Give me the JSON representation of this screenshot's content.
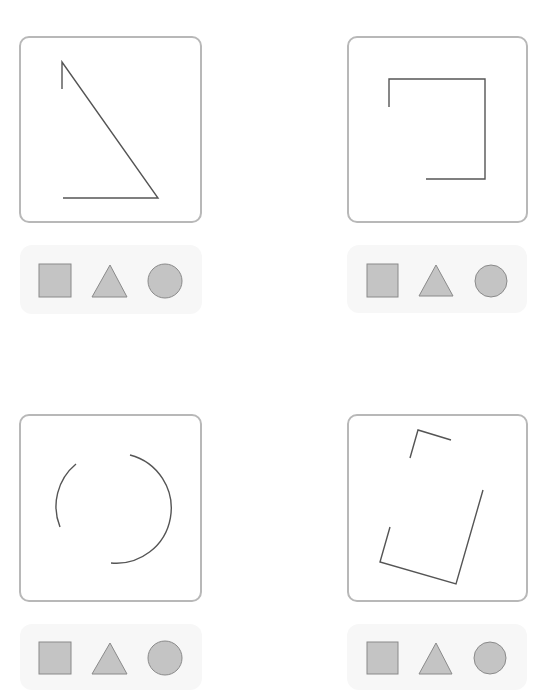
{
  "header": {
    "clipped_text": ""
  },
  "colors": {
    "line": "#555555",
    "panel_border": "#b8b8b8",
    "option_fill": "#c4c4c4",
    "option_stroke": "#8a8a8a",
    "strip_bg": "#f7f7f7"
  },
  "puzzles": [
    {
      "id": 1,
      "shape_hint": "triangle-outline-incomplete",
      "panel": {
        "x": 19,
        "y": 36,
        "w": 183,
        "h": 187
      },
      "paths": [
        "M62 89 L62 62 L158 198 L63 198"
      ],
      "strip": {
        "x": 20,
        "y": 245,
        "w": 182,
        "h": 69
      },
      "options": [
        {
          "type": "square",
          "x": 39,
          "y": 264,
          "w": 32,
          "h": 33
        },
        {
          "type": "triangle",
          "points": "92,297 110,265 127,297"
        },
        {
          "type": "circle",
          "cx": 165,
          "cy": 281,
          "r": 17
        }
      ]
    },
    {
      "id": 2,
      "shape_hint": "square-outline-incomplete",
      "panel": {
        "x": 347,
        "y": 36,
        "w": 181,
        "h": 187
      },
      "paths": [
        "M389 107 L389 79 L485 79 L485 179 L426 179"
      ],
      "strip": {
        "x": 347,
        "y": 245,
        "w": 180,
        "h": 68
      },
      "options": [
        {
          "type": "square",
          "x": 367,
          "y": 264,
          "w": 31,
          "h": 33
        },
        {
          "type": "triangle",
          "points": "419,296 436,265 453,296"
        },
        {
          "type": "circle",
          "cx": 491,
          "cy": 281,
          "r": 16
        }
      ]
    },
    {
      "id": 3,
      "shape_hint": "circle-outline-incomplete",
      "panel": {
        "x": 19,
        "y": 414,
        "w": 183,
        "h": 188
      },
      "paths": [
        "M76 464 A55 55 0 0 0 60 527",
        "M130 455 A55 55 0 0 1 111 563"
      ],
      "strip": {
        "x": 20,
        "y": 624,
        "w": 182,
        "h": 66
      },
      "options": [
        {
          "type": "square",
          "x": 39,
          "y": 642,
          "w": 32,
          "h": 32
        },
        {
          "type": "triangle",
          "points": "92,674 110,643 127,674"
        },
        {
          "type": "circle",
          "cx": 165,
          "cy": 658,
          "r": 17
        }
      ]
    },
    {
      "id": 4,
      "shape_hint": "rotated-rectangle-outline-incomplete",
      "panel": {
        "x": 347,
        "y": 414,
        "w": 181,
        "h": 188
      },
      "paths": [
        "M410 458 L418 430 L451 440",
        "M390 527 L380 562 L456 584 L483 490"
      ],
      "strip": {
        "x": 347,
        "y": 624,
        "w": 180,
        "h": 66
      },
      "options": [
        {
          "type": "square",
          "x": 367,
          "y": 642,
          "w": 31,
          "h": 32
        },
        {
          "type": "triangle",
          "points": "419,674 436,643 452,674"
        },
        {
          "type": "circle",
          "cx": 490,
          "cy": 658,
          "r": 16
        }
      ]
    }
  ]
}
